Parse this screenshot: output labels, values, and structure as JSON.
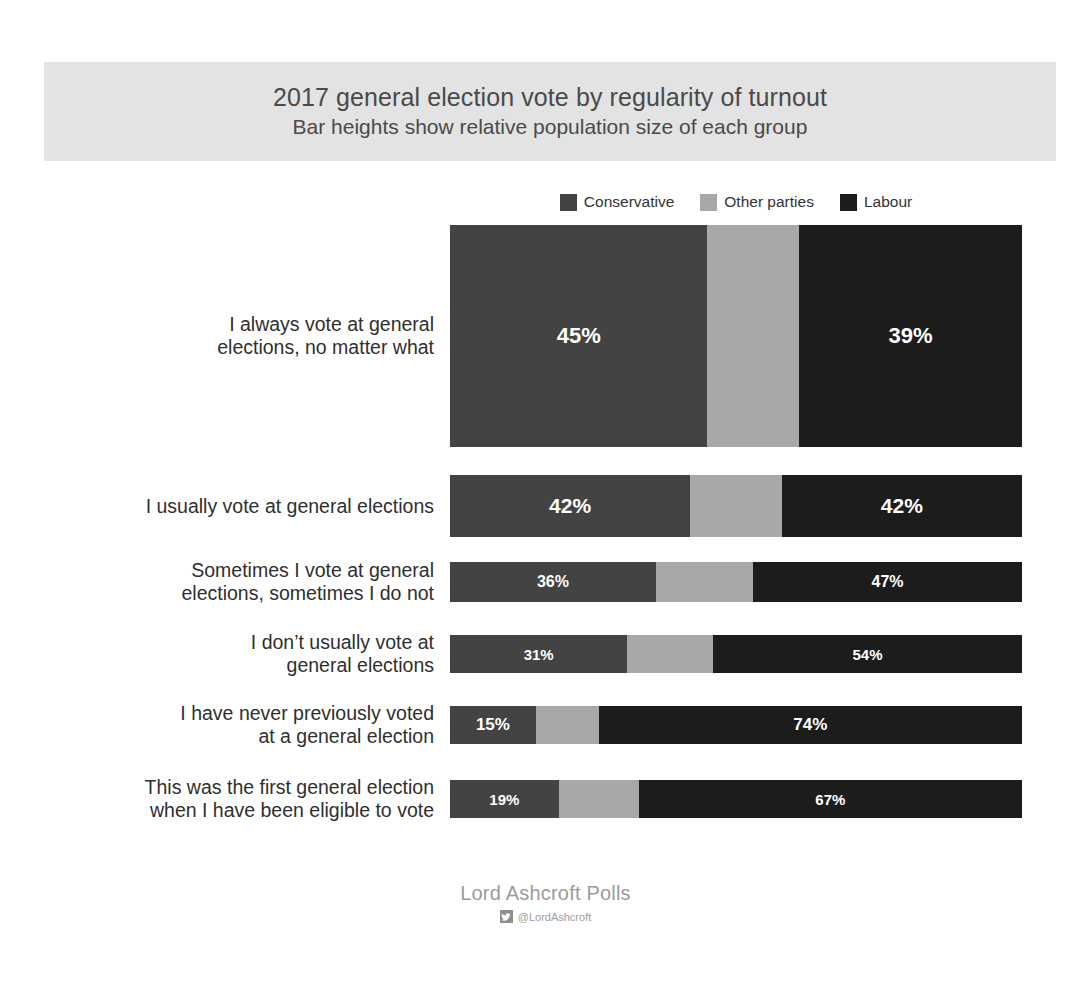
{
  "header": {
    "title": "2017 general election vote by regularity of turnout",
    "subtitle": "Bar heights show relative population size of each group",
    "band_color": "#e3e3e3"
  },
  "legend": {
    "items": [
      {
        "label": "Conservative",
        "color": "#434343"
      },
      {
        "label": "Other parties",
        "color": "#a8a8a8"
      },
      {
        "label": "Labour",
        "color": "#1c1c1c"
      }
    ]
  },
  "footer": {
    "brand": "Lord Ashcroft Polls",
    "handle": "@LordAshcroft",
    "icon": "twitter-icon"
  },
  "chart_data": {
    "type": "bar",
    "orientation": "horizontal",
    "stacked": true,
    "normalized": true,
    "title": "2017 general election vote by regularity of turnout",
    "subtitle": "Bar heights show relative population size of each group",
    "xlabel": "",
    "ylabel": "",
    "xlim": [
      0,
      100
    ],
    "grid": false,
    "legend_position": "top-center",
    "note": "Bar thickness encodes relative population size of each group",
    "categories": [
      "I always vote at general\nelections, no matter what",
      "I usually vote at general elections",
      "Sometimes I vote at general\nelections, sometimes I do not",
      "I don’t usually vote at\ngeneral elections",
      "I have never previously voted\nat a general election",
      "This was the first general election\nwhen I have been eligible to vote"
    ],
    "series": [
      {
        "name": "Conservative",
        "color": "#434343",
        "values": [
          45,
          42,
          36,
          31,
          15,
          19
        ]
      },
      {
        "name": "Other parties",
        "color": "#a8a8a8",
        "values": [
          16,
          16,
          17,
          15,
          11,
          14
        ]
      },
      {
        "name": "Labour",
        "color": "#1c1c1c",
        "values": [
          39,
          42,
          47,
          54,
          74,
          67
        ]
      }
    ],
    "bar_thickness_px": [
      222,
      62,
      40,
      38,
      38,
      38
    ],
    "rows": [
      {
        "category": "I always vote at general\nelections, no matter what",
        "thickness": 222,
        "gap_after": 28,
        "label_size": 19.5,
        "value_size": 22,
        "segments": [
          {
            "party": "Conservative",
            "value": 45,
            "label": "45%",
            "show_label": true,
            "color": "#434343"
          },
          {
            "party": "Other parties",
            "value": 16,
            "label": "16%",
            "show_label": false,
            "color": "#a8a8a8"
          },
          {
            "party": "Labour",
            "value": 39,
            "label": "39%",
            "show_label": true,
            "color": "#1c1c1c"
          }
        ]
      },
      {
        "category": "I usually vote at general elections",
        "thickness": 62,
        "gap_after": 25,
        "label_size": 19.5,
        "value_size": 21,
        "segments": [
          {
            "party": "Conservative",
            "value": 42,
            "label": "42%",
            "show_label": true,
            "color": "#434343"
          },
          {
            "party": "Other parties",
            "value": 16,
            "label": "16%",
            "show_label": false,
            "color": "#a8a8a8"
          },
          {
            "party": "Labour",
            "value": 42,
            "label": "42%",
            "show_label": true,
            "color": "#1c1c1c"
          }
        ]
      },
      {
        "category": "Sometimes I vote at general\nelections, sometimes I do not",
        "thickness": 40,
        "gap_after": 33,
        "label_size": 19.5,
        "value_size": 16,
        "segments": [
          {
            "party": "Conservative",
            "value": 36,
            "label": "36%",
            "show_label": true,
            "color": "#434343"
          },
          {
            "party": "Other parties",
            "value": 17,
            "label": "17%",
            "show_label": false,
            "color": "#a8a8a8"
          },
          {
            "party": "Labour",
            "value": 47,
            "label": "47%",
            "show_label": true,
            "color": "#1c1c1c"
          }
        ]
      },
      {
        "category": "I don’t usually vote at\ngeneral elections",
        "thickness": 38,
        "gap_after": 33,
        "label_size": 19.5,
        "value_size": 15,
        "segments": [
          {
            "party": "Conservative",
            "value": 31,
            "label": "31%",
            "show_label": true,
            "color": "#434343"
          },
          {
            "party": "Other parties",
            "value": 15,
            "label": "15%",
            "show_label": false,
            "color": "#a8a8a8"
          },
          {
            "party": "Labour",
            "value": 54,
            "label": "54%",
            "show_label": true,
            "color": "#1c1c1c"
          }
        ]
      },
      {
        "category": "I have never previously voted\nat a general election",
        "thickness": 38,
        "gap_after": 36,
        "label_size": 19.5,
        "value_size": 17,
        "segments": [
          {
            "party": "Conservative",
            "value": 15,
            "label": "15%",
            "show_label": true,
            "color": "#434343"
          },
          {
            "party": "Other parties",
            "value": 11,
            "label": "11%",
            "show_label": false,
            "color": "#a8a8a8"
          },
          {
            "party": "Labour",
            "value": 74,
            "label": "74%",
            "show_label": true,
            "color": "#1c1c1c"
          }
        ]
      },
      {
        "category": "This was the first general election\nwhen I have been eligible to vote",
        "thickness": 38,
        "gap_after": 0,
        "label_size": 19.5,
        "value_size": 15,
        "segments": [
          {
            "party": "Conservative",
            "value": 19,
            "label": "19%",
            "show_label": true,
            "color": "#434343"
          },
          {
            "party": "Other parties",
            "value": 14,
            "label": "14%",
            "show_label": false,
            "color": "#a8a8a8"
          },
          {
            "party": "Labour",
            "value": 67,
            "label": "67%",
            "show_label": true,
            "color": "#1c1c1c"
          }
        ]
      }
    ]
  }
}
